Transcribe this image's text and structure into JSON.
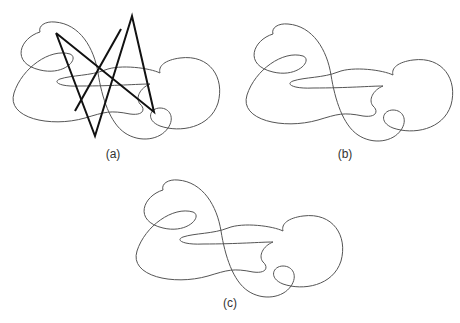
{
  "figure": {
    "panels": [
      {
        "id": "a",
        "label": "(a)",
        "description": "knot curve with bold polygonal approximation"
      },
      {
        "id": "b",
        "label": "(b)",
        "description": "smoothed knot curve"
      },
      {
        "id": "c",
        "label": "(c)",
        "description": "final knot curve"
      }
    ],
    "colors": {
      "curve": "#555555",
      "curve_light": "#999999",
      "polygon": "#111111",
      "background": "#ffffff"
    }
  }
}
